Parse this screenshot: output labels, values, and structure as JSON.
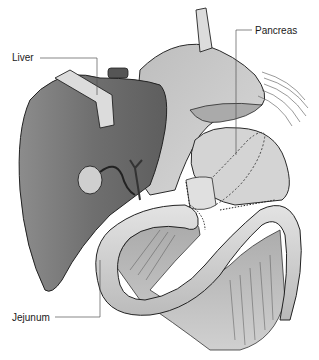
{
  "figure": {
    "type": "anatomical-illustration",
    "labels": [
      {
        "id": "liver",
        "text": "Liver"
      },
      {
        "id": "pancreas",
        "text": "Pancreas"
      },
      {
        "id": "jejunum",
        "text": "Jejunum"
      }
    ]
  },
  "labels": {
    "liver": "Liver",
    "pancreas": "Pancreas",
    "jejunum": "Jejunum"
  },
  "colors": {
    "liver_dark": "#6e6e6e",
    "liver_mid": "#8a8a8a",
    "organ_light": "#c8c8c8",
    "organ_lighter": "#dcdcdc",
    "outline": "#2a2a2a",
    "retractor": "#d8d8d8",
    "leader_line": "#555555"
  }
}
